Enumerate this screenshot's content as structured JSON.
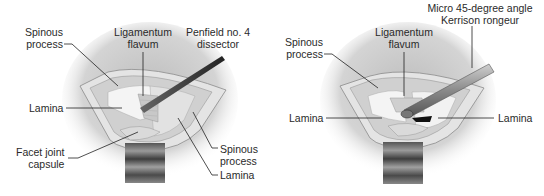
{
  "figure": {
    "left_panel": {
      "labels": {
        "spinous_process_top": [
          "Spinous",
          "process"
        ],
        "ligamentum_flavum": [
          "Ligamentum",
          "flavum"
        ],
        "instrument": [
          "Penfield no. 4",
          "dissector"
        ],
        "lamina_left": "Lamina",
        "facet_joint_capsule": [
          "Facet joint",
          "capsule"
        ],
        "spinous_process_right": [
          "Spinous",
          "process"
        ],
        "lamina_right": "Lamina"
      }
    },
    "right_panel": {
      "labels": {
        "instrument": [
          "Micro 45-degree angle",
          "Kerrison rongeur"
        ],
        "spinous_process": [
          "Spinous",
          "process"
        ],
        "ligamentum_flavum": [
          "Ligamentum",
          "flavum"
        ],
        "lamina_left": "Lamina",
        "lamina_right": "Lamina"
      }
    }
  }
}
